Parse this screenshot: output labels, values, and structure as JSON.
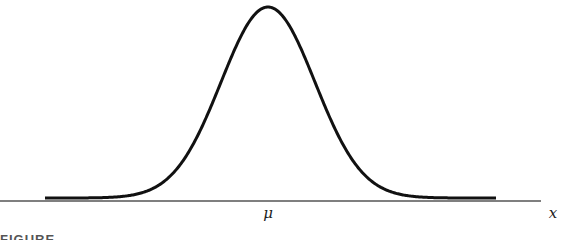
{
  "chart_data": {
    "type": "line",
    "title": "",
    "subtitle": "Normal distribution (bell curve)",
    "xlabel": "x",
    "ylabel": "",
    "x_tick_labels": [
      "μ"
    ],
    "annotations": [
      {
        "text": "μ",
        "position": "center of x-axis, at curve peak"
      }
    ],
    "series": [
      {
        "name": "normal density",
        "x": [
          -4.8,
          -4,
          -3,
          -2.5,
          -2,
          -1.5,
          -1,
          -0.5,
          0,
          0.5,
          1,
          1.5,
          2,
          2.5,
          3,
          4,
          4.8
        ],
        "values": [
          0.0,
          0.0001,
          0.0044,
          0.0175,
          0.054,
          0.1295,
          0.242,
          0.3521,
          0.3989,
          0.3521,
          0.242,
          0.1295,
          0.054,
          0.0175,
          0.0044,
          0.0001,
          0.0
        ]
      }
    ],
    "grid": false,
    "legend": "none",
    "line_color": "#111111",
    "axis_color": "#555555"
  },
  "labels": {
    "mu": "μ",
    "x": "x"
  },
  "caption": {
    "text": "FIGURE"
  }
}
